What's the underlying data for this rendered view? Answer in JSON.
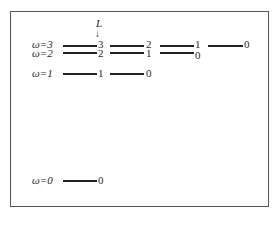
{
  "diagram": {
    "axis_label": "L",
    "arrow_glyph": "↓",
    "rows": [
      {
        "omega_label": "ω=3",
        "y": 45,
        "label_y": 39
      },
      {
        "omega_label": "ω=2",
        "y": 52,
        "label_y": 48
      },
      {
        "omega_label": "ω=1",
        "y": 73,
        "label_y": 68
      },
      {
        "omega_label": "ω=0",
        "y": 180,
        "label_y": 175
      }
    ],
    "levels": [
      {
        "x": 63,
        "y": 45,
        "w": 34,
        "L": "3",
        "lx": 98,
        "ly": 39
      },
      {
        "x": 63,
        "y": 52,
        "w": 34,
        "L": "2",
        "lx": 98,
        "ly": 48
      },
      {
        "x": 63,
        "y": 73,
        "w": 34,
        "L": "1",
        "lx": 98,
        "ly": 68
      },
      {
        "x": 63,
        "y": 180,
        "w": 34,
        "L": "0",
        "lx": 98,
        "ly": 175
      },
      {
        "x": 110,
        "y": 45,
        "w": 34,
        "L": "2",
        "lx": 146,
        "ly": 39
      },
      {
        "x": 110,
        "y": 52,
        "w": 34,
        "L": "1",
        "lx": 146,
        "ly": 48
      },
      {
        "x": 110,
        "y": 73,
        "w": 34,
        "L": "0",
        "lx": 146,
        "ly": 68
      },
      {
        "x": 160,
        "y": 45,
        "w": 34,
        "L": "1",
        "lx": 195,
        "ly": 39
      },
      {
        "x": 160,
        "y": 52,
        "w": 34,
        "L": "0",
        "lx": 195,
        "ly": 50
      },
      {
        "x": 208,
        "y": 45,
        "w": 35,
        "L": "0",
        "lx": 244,
        "ly": 39
      }
    ]
  }
}
